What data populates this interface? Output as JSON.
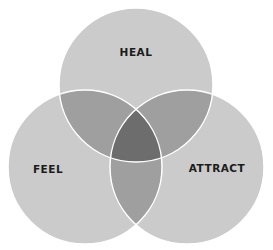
{
  "diagram": {
    "type": "venn-3",
    "sets": [
      {
        "id": "heal",
        "label": "HEAL"
      },
      {
        "id": "feel",
        "label": "FEEL"
      },
      {
        "id": "attract",
        "label": "ATTRACT"
      }
    ],
    "colors": {
      "single": "#cbcbcb",
      "double": "#9f9f9f",
      "triple": "#6d6d6d",
      "outline": "#ffffff"
    }
  }
}
